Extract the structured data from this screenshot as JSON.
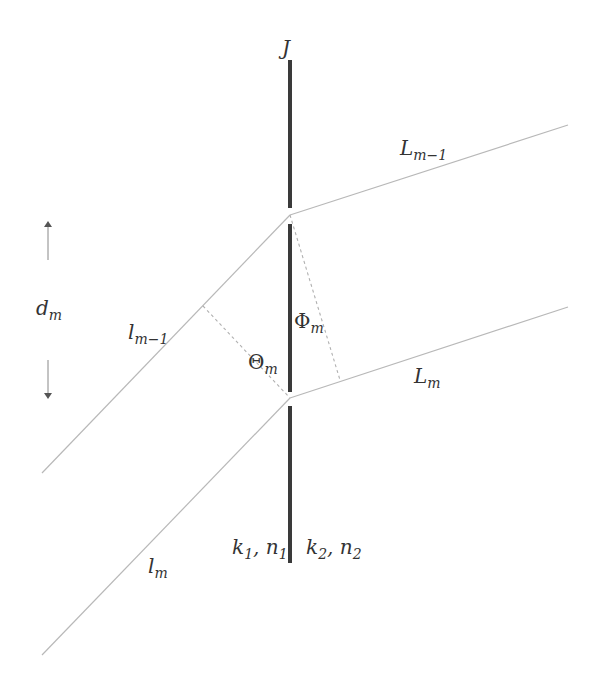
{
  "diagram": {
    "type": "ray-interface-geometry",
    "colors": {
      "interface": "#3a3a3a",
      "ray": "#b5b5b5",
      "dashed": "#b0b0b0",
      "text": "#333333"
    },
    "labels": {
      "interface": {
        "main": "J",
        "sub": ""
      },
      "L_upper": {
        "main": "L",
        "sub": "m−1"
      },
      "L_lower": {
        "main": "L",
        "sub": "m"
      },
      "l_upper": {
        "main": "l",
        "sub": "m−1"
      },
      "l_lower": {
        "main": "l",
        "sub": "m"
      },
      "spacing": {
        "main": "d",
        "sub": "m"
      },
      "phi": {
        "main": "Φ",
        "sub": "m"
      },
      "theta": {
        "main": "Θ",
        "sub": "m"
      },
      "medium1": {
        "k": "k",
        "k_sub": "1",
        "sep": ", ",
        "n": "n",
        "n_sub": "1"
      },
      "medium2": {
        "k": "k",
        "k_sub": "2",
        "sep": ", ",
        "n": "n",
        "n_sub": "2"
      }
    },
    "geometry": {
      "interface_segments": [
        [
          290,
          60,
          290,
          208
        ],
        [
          290,
          224,
          290,
          392
        ],
        [
          290,
          406,
          290,
          563
        ]
      ],
      "upper_junction": [
        290,
        215
      ],
      "lower_junction": [
        290,
        398
      ],
      "incident_rays": [
        [
          42,
          473,
          290,
          215
        ],
        [
          42,
          655,
          290,
          398
        ]
      ],
      "refracted_rays": [
        [
          290,
          215,
          568,
          125
        ],
        [
          290,
          398,
          568,
          307
        ]
      ],
      "dashed_perpendiculars": [
        [
          203,
          306,
          290,
          398
        ],
        [
          290,
          215,
          340,
          380
        ]
      ],
      "spacing_arrows": [
        [
          48,
          260,
          48,
          222
        ],
        [
          48,
          360,
          48,
          398
        ]
      ]
    }
  }
}
